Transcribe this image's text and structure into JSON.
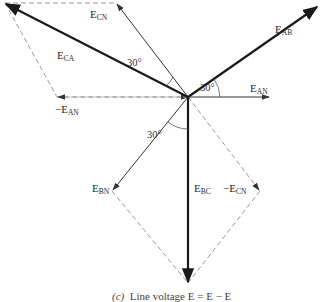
{
  "diagram": {
    "type": "phasor-diagram",
    "origin": [
      188,
      97
    ],
    "colors": {
      "thick": "#1a1a1a",
      "thin": "#333333",
      "dashed": "#9a9a9a"
    },
    "phasors": [
      {
        "id": "E_AB",
        "label": "E",
        "sub": "AB",
        "tip": [
          318,
          6
        ],
        "style": "thick"
      },
      {
        "id": "E_AN",
        "label": "E",
        "sub": "AN",
        "tip": [
          270,
          97
        ],
        "style": "thin"
      },
      {
        "id": "E_CN",
        "label": "E",
        "sub": "CN",
        "tip": [
          116,
          3
        ],
        "style": "thin"
      },
      {
        "id": "E_CA",
        "label": "E",
        "sub": "CA",
        "tip": [
          5,
          3
        ],
        "style": "thick"
      },
      {
        "id": "-E_AN",
        "label": "−E",
        "sub": "AN",
        "tip": [
          57,
          97
        ],
        "style": "dashed"
      },
      {
        "id": "E_BN",
        "label": "E",
        "sub": "BN",
        "tip": [
          112,
          191
        ],
        "style": "thin"
      },
      {
        "id": "-E_CN",
        "label": "−E",
        "sub": "CN",
        "tip": [
          260,
          191
        ],
        "style": "dashed"
      },
      {
        "id": "E_BC",
        "label": "E",
        "sub": "BC",
        "tip": [
          188,
          283
        ],
        "style": "thick"
      }
    ],
    "angles": [
      {
        "label": "30°",
        "between": [
          "E_AN",
          "E_AB"
        ]
      },
      {
        "label": "30°",
        "between": [
          "E_CN",
          "E_CA"
        ]
      },
      {
        "label": "30°",
        "between": [
          "E_BN",
          "E_BC"
        ]
      }
    ],
    "labels": {
      "e_ab": {
        "main": "E",
        "sub": "AB"
      },
      "e_an": {
        "main": "E",
        "sub": "AN"
      },
      "e_cn": {
        "main": "E",
        "sub": "CN"
      },
      "e_ca": {
        "main": "E",
        "sub": "CA"
      },
      "neg_e_an": {
        "main": "−E",
        "sub": "AN"
      },
      "e_bn": {
        "main": "E",
        "sub": "BN"
      },
      "neg_e_cn": {
        "main": "−E",
        "sub": "CN"
      },
      "e_bc": {
        "main": "E",
        "sub": "BC"
      },
      "angle_ab": "30°",
      "angle_ca": "30°",
      "angle_bc": "30°"
    },
    "caption": {
      "part": "(c)",
      "text": "Line voltage E   = E   − E  "
    }
  }
}
